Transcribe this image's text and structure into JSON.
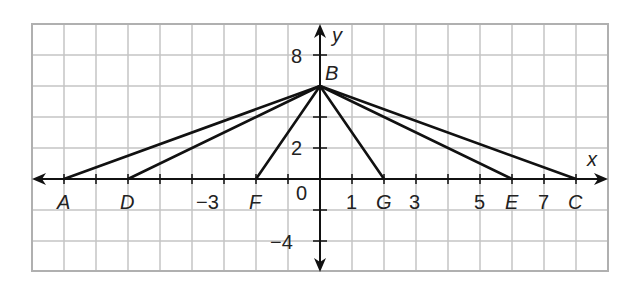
{
  "graph": {
    "axes": {
      "x_label": "x",
      "y_label": "y"
    },
    "x_ticks": [
      {
        "value": -3,
        "label": "−3"
      },
      {
        "value": 0,
        "label": "0"
      },
      {
        "value": 1,
        "label": "1"
      },
      {
        "value": 3,
        "label": "3"
      },
      {
        "value": 5,
        "label": "5"
      },
      {
        "value": 7,
        "label": "7"
      }
    ],
    "y_ticks": [
      {
        "value": 8,
        "label": "8"
      },
      {
        "value": 2,
        "label": "2"
      },
      {
        "value": -4,
        "label": "−4"
      }
    ],
    "points": {
      "A": {
        "label": "A",
        "x": -8,
        "y": 0
      },
      "D": {
        "label": "D",
        "x": -6,
        "y": 0
      },
      "F": {
        "label": "F",
        "x": -2,
        "y": 0
      },
      "G": {
        "label": "G",
        "x": 2,
        "y": 0
      },
      "E": {
        "label": "E",
        "x": 6,
        "y": 0
      },
      "C": {
        "label": "C",
        "x": 8,
        "y": 0
      },
      "B": {
        "label": "B",
        "x": 0,
        "y": 6
      }
    },
    "segments": [
      "BA",
      "BD",
      "BF",
      "BG",
      "BE",
      "BC"
    ],
    "grid": {
      "x_range": [
        -9,
        9
      ],
      "y_range": [
        -6,
        10
      ],
      "x_step": 1,
      "y_step": 2
    }
  }
}
